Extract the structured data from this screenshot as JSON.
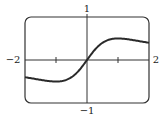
{
  "chart_data": {
    "type": "line",
    "title": "",
    "xlabel": "",
    "ylabel": "",
    "xlim": [
      -2,
      2
    ],
    "ylim": [
      -1,
      1
    ],
    "grid": false,
    "legend": null,
    "function_estimate": "y = x/(1+x^2)",
    "tick_labels": {
      "x_left": "−2",
      "x_right": "2",
      "y_top": "1",
      "y_bottom": "−1"
    },
    "x_ticks": [
      -1,
      1
    ],
    "series": [
      {
        "name": "curve",
        "x": [
          -2,
          -1.75,
          -1.5,
          -1.25,
          -1,
          -0.75,
          -0.5,
          -0.25,
          0,
          0.25,
          0.5,
          0.75,
          1,
          1.25,
          1.5,
          1.75,
          2
        ],
        "values": [
          -0.4,
          -0.43,
          -0.46,
          -0.49,
          -0.5,
          -0.48,
          -0.4,
          -0.24,
          0,
          0.24,
          0.4,
          0.48,
          0.5,
          0.49,
          0.46,
          0.43,
          0.4
        ]
      }
    ],
    "colors": {
      "curve": "#2a2a2a",
      "axes": "#333333",
      "frame": "#333333"
    }
  }
}
